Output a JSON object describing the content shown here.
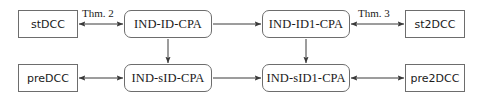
{
  "diagram": {
    "type": "relation-graph",
    "title": "",
    "nodes": [
      {
        "id": "stDCC",
        "label": "stDCC",
        "shape": "rectangle",
        "x": 18,
        "y": 10,
        "w": 60,
        "h": 28
      },
      {
        "id": "IND-ID-CPA",
        "label": "IND-ID-CPA",
        "shape": "rounded-rectangle",
        "x": 124,
        "y": 10,
        "w": 88,
        "h": 28
      },
      {
        "id": "IND-ID1-CPA",
        "label": "IND-ID1-CPA",
        "shape": "rounded-rectangle",
        "x": 262,
        "y": 10,
        "w": 88,
        "h": 28
      },
      {
        "id": "st2DCC",
        "label": "st2DCC",
        "shape": "rectangle",
        "x": 405,
        "y": 10,
        "w": 60,
        "h": 28
      },
      {
        "id": "preDCC",
        "label": "preDCC",
        "shape": "rectangle",
        "x": 18,
        "y": 64,
        "w": 60,
        "h": 28
      },
      {
        "id": "IND-sID-CPA",
        "label": "IND-sID-CPA",
        "shape": "rounded-rectangle",
        "x": 124,
        "y": 64,
        "w": 88,
        "h": 28
      },
      {
        "id": "IND-sID1-CPA",
        "label": "IND-sID1-CPA",
        "shape": "rounded-rectangle",
        "x": 262,
        "y": 64,
        "w": 88,
        "h": 28
      },
      {
        "id": "pre2DCC",
        "label": "pre2DCC",
        "shape": "rectangle",
        "x": 405,
        "y": 64,
        "w": 60,
        "h": 28
      }
    ],
    "edges": [
      {
        "id": "e1",
        "from": "stDCC",
        "to": "IND-ID-CPA",
        "direction": "bidirectional",
        "orientation": "horizontal",
        "label": "Thm. 2"
      },
      {
        "id": "e2",
        "from": "IND-ID-CPA",
        "to": "IND-ID1-CPA",
        "direction": "forward",
        "orientation": "horizontal",
        "label": ""
      },
      {
        "id": "e3",
        "from": "IND-ID1-CPA",
        "to": "st2DCC",
        "direction": "bidirectional",
        "orientation": "horizontal",
        "label": "Thm. 3"
      },
      {
        "id": "e4",
        "from": "preDCC",
        "to": "IND-sID-CPA",
        "direction": "bidirectional",
        "orientation": "horizontal",
        "label": ""
      },
      {
        "id": "e5",
        "from": "IND-sID-CPA",
        "to": "IND-sID1-CPA",
        "direction": "forward",
        "orientation": "horizontal",
        "label": ""
      },
      {
        "id": "e6",
        "from": "IND-sID1-CPA",
        "to": "pre2DCC",
        "direction": "bidirectional",
        "orientation": "horizontal",
        "label": ""
      },
      {
        "id": "e7",
        "from": "IND-ID-CPA",
        "to": "IND-sID-CPA",
        "direction": "forward",
        "orientation": "vertical",
        "label": ""
      },
      {
        "id": "e8",
        "from": "IND-ID1-CPA",
        "to": "IND-sID1-CPA",
        "direction": "forward",
        "orientation": "vertical",
        "label": ""
      }
    ],
    "edge_labels": [
      {
        "id": "thm2",
        "text": "Thm. 2",
        "x": 82,
        "y": 7
      },
      {
        "id": "thm3",
        "text": "Thm. 3",
        "x": 358,
        "y": 7
      }
    ],
    "colors": {
      "background": "#ffffff",
      "node_border": "#6d6d6d",
      "node_fill": "#ffffff",
      "text": "#1a1a1a",
      "edge": "#3a3a3a"
    }
  }
}
